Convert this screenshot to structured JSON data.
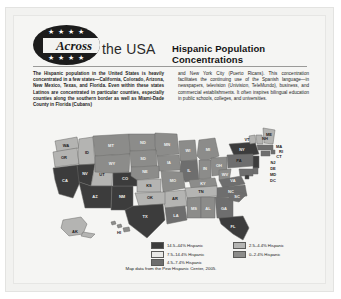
{
  "page": {
    "background_color": "#f5f5f3",
    "border_color": "#e6e6e4"
  },
  "header": {
    "logo_stars_top": "★ ★ ★ ★",
    "logo_stars_bottom": "★ ★ ★ ★",
    "logo_word": "Across",
    "logo_tail": "the USA",
    "headline": "Hispanic Population Concentrations"
  },
  "body": {
    "column_left": "The Hispanic population in the United States is heavily concentrated in a few states—California, Colorado, Arizona, New Mexico, Texas, and Florida. Even within these states Latinos are concentrated in particular counties, especially counties along the southern border as well as Miami-Dade County in Florida (Cubans)",
    "column_right": "and New York City (Puerto Ricans). This concentration facilitates the continuing use of the Spanish language—in newspapers, television (Univision, TeleMundo), business, and commercial establishments. It often inspires bilingual education in public schools, colleges, and universities."
  },
  "map": {
    "title": "Hispanic Population Concentrations",
    "caption": "Map data from the Pew Hispanic Center, 2005.",
    "colors": {
      "b5": "#3c3c3c",
      "b4": "#e8e8e6",
      "b3": "#6e6e6e",
      "b2": "#b4b4b2",
      "b1": "#8c8c8a",
      "outline": "#5a5a58",
      "ocean": "#f5f5f3"
    },
    "legend": {
      "column_1": [
        {
          "swatch": "#3c3c3c",
          "label": "14.5–44% Hispanic"
        },
        {
          "swatch": "#e8e8e6",
          "label": "7.5–14.4% Hispanic"
        },
        {
          "swatch": "#6e6e6e",
          "label": "4.5–7.4% Hispanic"
        }
      ],
      "column_2": [
        {
          "swatch": "#b4b4b2",
          "label": "2.5–4.4% Hispanic"
        },
        {
          "swatch": "#8c8c8a",
          "label": "0–2.4% Hispanic"
        }
      ]
    },
    "state_labels": [
      "WA",
      "OR",
      "ID",
      "MT",
      "ND",
      "MN",
      "WI",
      "MI",
      "NY",
      "VT",
      "NH",
      "ME",
      "MA",
      "RI",
      "CT",
      "CA",
      "NV",
      "UT",
      "WY",
      "SD",
      "IA",
      "IL",
      "IN",
      "OH",
      "PA",
      "NJ",
      "DE",
      "MD",
      "DC",
      "AZ",
      "NM",
      "CO",
      "NE",
      "KS",
      "MO",
      "KY",
      "WV",
      "VA",
      "NC",
      "TN",
      "AR",
      "OK",
      "TX",
      "LA",
      "MS",
      "AL",
      "GA",
      "SC",
      "FL",
      "AK",
      "HI"
    ]
  }
}
